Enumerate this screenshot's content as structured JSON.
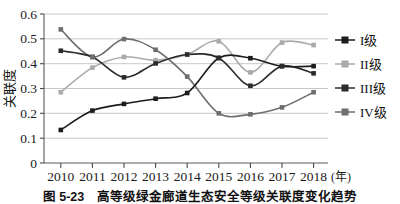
{
  "chart_data": {
    "type": "line",
    "title": "",
    "xlabel": "(年)",
    "ylabel": "关联度",
    "categories": [
      "2010",
      "2011",
      "2012",
      "2013",
      "2014",
      "2015",
      "2016",
      "2017",
      "2018"
    ],
    "x": [
      2010,
      2011,
      2012,
      2013,
      2014,
      2015,
      2016,
      2017,
      2018
    ],
    "ylim": [
      0,
      0.6
    ],
    "ytick_labels": [
      "0",
      "0.1",
      "0.2",
      "0.3",
      "0.4",
      "0.5",
      "0.6"
    ],
    "ytick_values": [
      0,
      0.1,
      0.2,
      0.3,
      0.4,
      0.5,
      0.6
    ],
    "grid": "horizontal",
    "legend_position": "right",
    "marker": "square",
    "smoothing": "spline",
    "series": [
      {
        "name": "I级",
        "color": "#1c1c1c",
        "values": [
          0.133,
          0.211,
          0.238,
          0.259,
          0.282,
          0.423,
          0.422,
          0.39,
          0.39
        ]
      },
      {
        "name": "II级",
        "color": "#aaaaaa",
        "values": [
          0.285,
          0.384,
          0.427,
          0.414,
          0.437,
          0.49,
          0.365,
          0.485,
          0.475
        ]
      },
      {
        "name": "III级",
        "color": "#2b2b2b",
        "values": [
          0.452,
          0.427,
          0.345,
          0.401,
          0.437,
          0.423,
          0.311,
          0.39,
          0.361
        ]
      },
      {
        "name": "IV级",
        "color": "#6e6e6e",
        "values": [
          0.538,
          0.427,
          0.499,
          0.456,
          0.348,
          0.2,
          0.196,
          0.224,
          0.285
        ]
      }
    ]
  },
  "legend": {
    "items": [
      {
        "label": "I级"
      },
      {
        "label": "II级"
      },
      {
        "label": "III级"
      },
      {
        "label": "IV级"
      }
    ]
  },
  "caption": {
    "text": "图 5-23　高等级绿金廊道生态安全等级关联度变化趋势"
  },
  "colors": {
    "grid": "#b9b9b9",
    "frame": "#5a5a5a",
    "background": "#ffffff",
    "text": "#111111"
  }
}
